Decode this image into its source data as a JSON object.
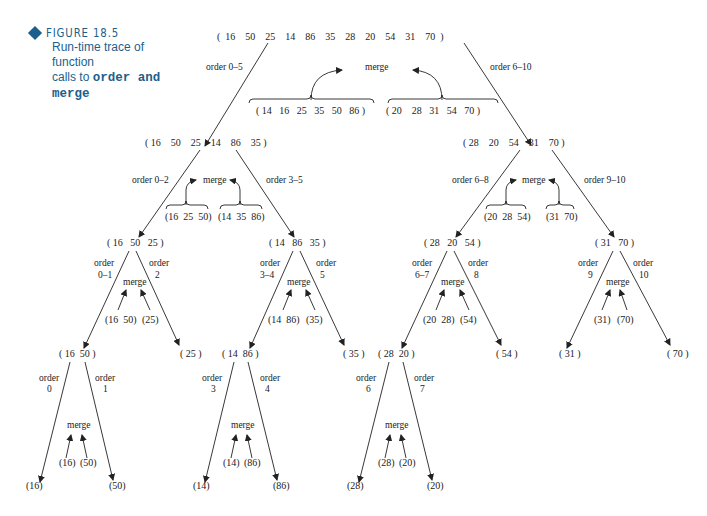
{
  "figure": {
    "label": "FIGURE 18.5",
    "description_prefix": "Run-time trace of function",
    "description_mid": "calls to ",
    "code_a": "order and",
    "code_b": "merge",
    "accent_color": "#1c5f8c"
  },
  "tree": {
    "root": {
      "list": "(  16    50    25    14    86    35    28    20    54    31    70  )",
      "left_call": "order 0–5",
      "right_call": "order 6–10",
      "merge_label": "merge",
      "merged_left": "( 14   16   25   35   50   86 )",
      "merged_right": "( 20    28   31   54   70 )"
    },
    "level1_left": {
      "list": "( 16    50    25    14    86    35 )",
      "left_call": "order 0–2",
      "right_call": "order 3–5",
      "merge_label": "merge",
      "merged_left": "(16  25  50)",
      "merged_right": "(14  35  86)"
    },
    "level1_right": {
      "list": "( 28    20    54    31    70 )",
      "left_call": "order 6–8",
      "right_call": "order 9–10",
      "merge_label": "merge",
      "merged_left": "(20  28  54)",
      "merged_right": "(31  70)"
    },
    "level2": [
      {
        "list": "( 16   50   25 )",
        "left_call_1": "order",
        "left_call_2": "0–1",
        "right_call_1": "order",
        "right_call_2": "2",
        "merge_label": "merge",
        "merged_left": "(16  50)",
        "merged_right": "(25)"
      },
      {
        "list": "( 14   86   35 )",
        "left_call_1": "order",
        "left_call_2": "3–4",
        "right_call_1": "order",
        "right_call_2": "5",
        "merge_label": "merge",
        "merged_left": "(14  86)",
        "merged_right": "(35)"
      },
      {
        "list": "( 28   20   54 )",
        "left_call_1": "order",
        "left_call_2": "6–7",
        "right_call_1": "order",
        "right_call_2": "8",
        "merge_label": "merge",
        "merged_left": "(20  28)",
        "merged_right": "(54)"
      },
      {
        "list": "( 31   70 )",
        "left_call_1": "order",
        "left_call_2": "9",
        "right_call_1": "order",
        "right_call_2": "10",
        "merge_label": "merge",
        "merged_left": "(31)",
        "merged_right": "(70)"
      }
    ],
    "level3": [
      {
        "list": "( 16  50 )",
        "left_call_1": "order",
        "left_call_2": "0",
        "right_call_1": "order",
        "right_call_2": "1",
        "merge_label": "merge",
        "merged_left": "(16)",
        "merged_right": "(50)",
        "leaf_left": "(16)",
        "leaf_right": "(50)"
      },
      {
        "list": "( 25 )"
      },
      {
        "list": "( 14  86 )",
        "left_call_1": "order",
        "left_call_2": "3",
        "right_call_1": "order",
        "right_call_2": "4",
        "merge_label": "merge",
        "merged_left": "(14)",
        "merged_right": "(86)",
        "leaf_left": "(14)",
        "leaf_right": "(86)"
      },
      {
        "list": "( 35 )"
      },
      {
        "list": "( 28  20 )",
        "left_call_1": "order",
        "left_call_2": "6",
        "right_call_1": "order",
        "right_call_2": "7",
        "merge_label": "merge",
        "merged_left": "(28)",
        "merged_right": "(20)",
        "leaf_left": "(28)",
        "leaf_right": "(20)"
      },
      {
        "list": "( 54 )"
      },
      {
        "list": "( 31 )"
      },
      {
        "list": "( 70 )"
      }
    ]
  }
}
